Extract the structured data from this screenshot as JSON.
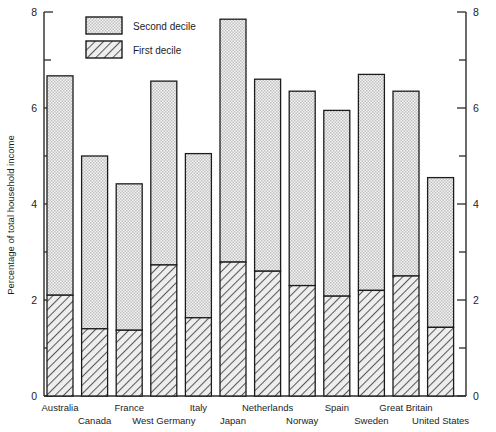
{
  "chart_data": {
    "type": "bar",
    "title": "",
    "subtitle": "",
    "xlabel": "",
    "ylabel": "Percentage of total household income",
    "ylim": [
      0,
      8
    ],
    "y_ticks_major": [
      0,
      2,
      4,
      6,
      8
    ],
    "y_ticks_minor": [
      1,
      3,
      5,
      7
    ],
    "y_tick_labels": [
      "0",
      "2",
      "4",
      "6",
      "8"
    ],
    "grid": false,
    "stacked": true,
    "legend_position": "top-left-inside",
    "categories": [
      "Australia",
      "Canada",
      "France",
      "West Germany",
      "Italy",
      "Japan",
      "Netherlands",
      "Norway",
      "Spain",
      "Sweden",
      "Great Britain",
      "United States"
    ],
    "series": [
      {
        "name": "First decile",
        "fill": "hatch",
        "color": "#d6d6d6",
        "values": [
          2.1,
          1.4,
          1.37,
          2.73,
          1.63,
          2.79,
          2.6,
          2.3,
          2.08,
          2.2,
          2.5,
          1.43
        ]
      },
      {
        "name": "Second decile",
        "fill": "stipple",
        "color": "#dcdcdc",
        "values": [
          4.57,
          3.6,
          3.05,
          3.83,
          3.42,
          5.06,
          4.0,
          4.05,
          3.87,
          4.5,
          3.85,
          3.12
        ]
      }
    ],
    "totals": [
      6.67,
      5.0,
      4.42,
      6.56,
      5.05,
      7.85,
      6.6,
      6.35,
      5.95,
      6.7,
      6.35,
      4.55
    ],
    "right_axis": {
      "mirror": true,
      "ylim": [
        0,
        8
      ],
      "y_tick_labels": [
        "0",
        "2",
        "4",
        "6",
        "8"
      ]
    },
    "legend": [
      {
        "label": "Second decile",
        "swatch": "stipple"
      },
      {
        "label": "First decile",
        "swatch": "hatch"
      }
    ],
    "colors": {
      "axis": "#2b2b2b",
      "bar_outline": "#1c1c1c",
      "second_decile_fill": "#dcdcdc",
      "first_decile_fill": "#d6d6d6",
      "background": "#ffffff"
    }
  }
}
